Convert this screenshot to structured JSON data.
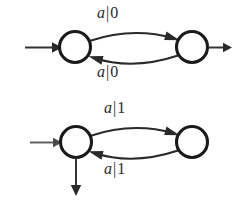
{
  "figure": {
    "name": "mealy-machine-pair",
    "background_color": "#ffffff",
    "ink_color": "#2a2a2a"
  },
  "diagrams": [
    {
      "id": "top",
      "name": "two-state-machine-output-0",
      "states": [
        {
          "id": "t-left",
          "label": "",
          "cx": 75,
          "cy": 47,
          "r": 15.5,
          "accepting": false,
          "has_start_arrow": true,
          "has_output_arrow": false
        },
        {
          "id": "t-right",
          "label": "",
          "cx": 192,
          "cy": 47,
          "r": 15.5,
          "accepting": false,
          "has_start_arrow": false,
          "has_output_arrow": true
        }
      ],
      "transitions": [
        {
          "from": "t-left",
          "to": "t-right",
          "input": "a",
          "separator": "|",
          "output": "0",
          "label": "a|0",
          "direction": "forward"
        },
        {
          "from": "t-right",
          "to": "t-left",
          "input": "a",
          "separator": "|",
          "output": "0",
          "label": "a|0",
          "direction": "backward"
        }
      ],
      "arrows": [
        {
          "id": "t-start",
          "kind": "incoming",
          "label": ""
        },
        {
          "id": "t-output",
          "kind": "outgoing-right",
          "label": ""
        }
      ]
    },
    {
      "id": "bottom",
      "name": "two-state-machine-output-1",
      "states": [
        {
          "id": "b-left",
          "label": "",
          "cx": 76,
          "cy": 142,
          "r": 15.5,
          "accepting": false,
          "has_start_arrow": true,
          "has_output_arrow": true
        },
        {
          "id": "b-right",
          "label": "",
          "cx": 192,
          "cy": 142,
          "r": 15.5,
          "accepting": false,
          "has_start_arrow": false,
          "has_output_arrow": false
        }
      ],
      "transitions": [
        {
          "from": "b-left",
          "to": "b-right",
          "input": "a",
          "separator": "|",
          "output": "1",
          "label": "a|1",
          "direction": "forward"
        },
        {
          "from": "b-right",
          "to": "b-left",
          "input": "a",
          "separator": "|",
          "output": "1",
          "label": "a|1",
          "direction": "backward"
        }
      ],
      "arrows": [
        {
          "id": "b-start",
          "kind": "incoming",
          "label": ""
        },
        {
          "id": "b-output",
          "kind": "outgoing-down",
          "label": ""
        }
      ]
    }
  ],
  "labels": {
    "top_upper": {
      "sym": "a",
      "bar": "|",
      "out": "0"
    },
    "top_lower": {
      "sym": "a",
      "bar": "|",
      "out": "0"
    },
    "bottom_upper": {
      "sym": "a",
      "bar": "|",
      "out": "1"
    },
    "bottom_lower": {
      "sym": "a",
      "bar": "|",
      "out": "1"
    }
  }
}
